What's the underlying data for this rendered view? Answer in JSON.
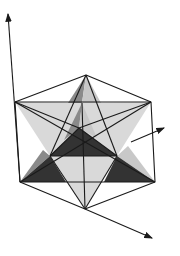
{
  "figure": {
    "title": "",
    "colors": {
      "background": "#ffffff",
      "edge": "#1a1a1a",
      "light_face": "#d9d9d9",
      "mid_face": "#8a8a8a",
      "dark_face": "#333333",
      "lighter_face": "#e6e6e6"
    },
    "axes": [
      {
        "name": "vertical-axis",
        "from": [
          35,
          180
        ],
        "to": [
          8,
          14
        ]
      },
      {
        "name": "right-axis",
        "from": [
          131,
          142
        ],
        "to": [
          164,
          128
        ]
      },
      {
        "name": "lower-axis",
        "from": [
          85,
          209
        ],
        "to": [
          152,
          238
        ]
      }
    ],
    "vertices": {
      "top_apex": [
        86,
        75
      ],
      "upper_left": [
        15,
        102
      ],
      "upper_right": [
        151,
        102
      ],
      "lower_left": [
        20,
        182
      ],
      "lower_right": [
        155,
        182
      ],
      "bottom_apex": [
        85,
        209
      ],
      "center": [
        79,
        128
      ],
      "inner_left": [
        50,
        156
      ],
      "inner_right": [
        117,
        156
      ],
      "front_top": [
        82,
        103
      ]
    }
  }
}
